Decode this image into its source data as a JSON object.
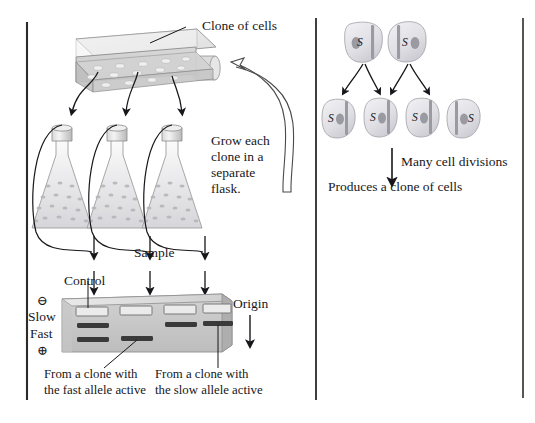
{
  "figure": {
    "title_text_visible": false,
    "panels": [
      "left-experiment-panel",
      "right-cell-division-panel"
    ]
  },
  "labels": {
    "clone_of_cells": "Clone of cells",
    "grow_each_clone": "Grow each\nclone in a\nseparate\nflask.",
    "grow_line1": "Grow each",
    "grow_line2": "clone in a",
    "grow_line3": "separate",
    "grow_line4": "flask.",
    "sample": "Sample",
    "control": "Control",
    "origin": "Origin",
    "slow": "Slow",
    "fast": "Fast",
    "cathode_symbol": "⊖",
    "anode_symbol": "⊕",
    "caption_fast_line1": "From a clone with",
    "caption_fast_line2": "the fast allele active",
    "caption_slow_line1": "From a clone with",
    "caption_slow_line2": "the slow allele active",
    "many_cell_divisions": "Many cell divisions",
    "produces_clone": "Produces a clone of cells",
    "allele_symbol": "S"
  },
  "gel": {
    "lane_count": 4,
    "lanes": [
      {
        "id": "lane-1",
        "role": "Control",
        "wells": true,
        "bands": [
          "slow",
          "fast"
        ]
      },
      {
        "id": "lane-2",
        "role": "Sample",
        "wells": true,
        "bands": [
          "fast"
        ]
      },
      {
        "id": "lane-3",
        "role": "Sample",
        "wells": true,
        "bands": [
          "slow"
        ]
      },
      {
        "id": "lane-4",
        "role": "Sample",
        "wells": true,
        "bands": [
          "slow"
        ]
      }
    ],
    "band_positions": {
      "slow": "upper",
      "fast": "lower"
    },
    "migration_direction": "from ⊖ (top) toward ⊕ (bottom)"
  },
  "culture_vessel": {
    "kind": "tissue-culture-flask",
    "colony_count_visible": 14,
    "colony_label": "Clone of cells"
  },
  "flasks": {
    "count": 3,
    "kind": "erlenmeyer-flask-with-cap"
  },
  "cell_division": {
    "row1_cells": [
      {
        "id": "cell-r1-1",
        "label": "S",
        "nucleus_side": "left"
      },
      {
        "id": "cell-r1-2",
        "label": "S",
        "nucleus_side": "right"
      }
    ],
    "row2_cells": [
      {
        "id": "cell-r2-1",
        "label": "S",
        "nucleus_side": "right"
      },
      {
        "id": "cell-r2-2",
        "label": "S",
        "nucleus_side": "right"
      },
      {
        "id": "cell-r2-3",
        "label": "S",
        "nucleus_side": "right"
      },
      {
        "id": "cell-r2-4",
        "label": "S",
        "nucleus_side": "left"
      }
    ],
    "division_arrows": 4,
    "downstream_label": "Many cell divisions",
    "outcome_label": "Produces a clone of cells"
  },
  "colors": {
    "ink": "#17171b",
    "gel_face": "#c9c9c9",
    "gel_top": "#e2e2e2",
    "gel_side": "#a5a5a5",
    "band": "#3a3a3a",
    "well_fill": "#e8e8e8",
    "cell_fill": "#dedee2",
    "nucleus": "#8e8e96",
    "chromosome_bar": "#9a9aa2",
    "glass": "#ececee",
    "rule": "#2b2b2b"
  }
}
